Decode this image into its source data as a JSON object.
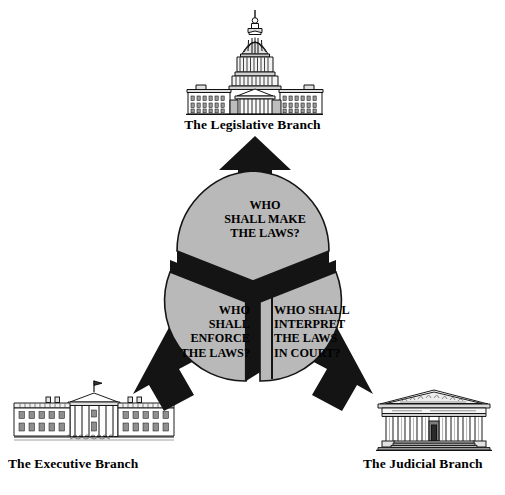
{
  "diagram": {
    "background_color": "#ffffff",
    "wedge_fill_color": "#b9b9b9",
    "wedge_edge_color": "#141414",
    "arrow_color": "#141414",
    "text_color": "#000000"
  },
  "branches": [
    {
      "id": "legislative",
      "label": "The Legislative Branch",
      "icon": "capitol-building-icon",
      "question": "WHO\nSHALL MAKE\nTHE LAWS?",
      "question_lines": [
        "WHO",
        "SHALL MAKE",
        "THE LAWS?"
      ],
      "arrow": "arrow-up",
      "arrow_direction": "up",
      "text_align": "center"
    },
    {
      "id": "executive",
      "label": "The Executive Branch",
      "icon": "white-house-icon",
      "question": "WHO\nSHALL\nENFORCE\nTHE LAWS?",
      "question_lines": [
        "WHO",
        "SHALL",
        "ENFORCE",
        "THE LAWS?"
      ],
      "arrow": "arrow-down-left",
      "arrow_direction": "down-left",
      "text_align": "right"
    },
    {
      "id": "judicial",
      "label": "The Judicial Branch",
      "icon": "supreme-court-icon",
      "question": "WHO SHALL\nINTERPRET\nTHE LAWS\nIN COURT?",
      "question_lines": [
        "WHO SHALL",
        "INTERPRET",
        "THE LAWS",
        "IN COURT?"
      ],
      "arrow": "arrow-down-right",
      "arrow_direction": "down-right",
      "text_align": "left"
    }
  ]
}
